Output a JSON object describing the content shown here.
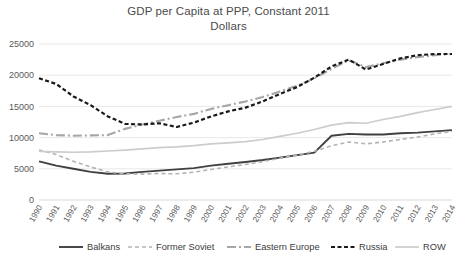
{
  "chart_data": {
    "type": "line",
    "title": "GDP per Capita at PPP, Constant 2011 Dollars",
    "title_line1": "GDP per Capita at PPP, Constant 2011",
    "title_line2": "Dollars",
    "xlabel": "",
    "ylabel": "",
    "ylim": [
      0,
      25000
    ],
    "yticks": [
      0,
      5000,
      10000,
      15000,
      20000,
      25000
    ],
    "ytick_labels": [
      "0",
      "5000",
      "10000",
      "15000",
      "20000",
      "25000"
    ],
    "grid": true,
    "legend_position": "bottom",
    "categories": [
      1990,
      1991,
      1992,
      1993,
      1994,
      1995,
      1996,
      1997,
      1998,
      1999,
      2000,
      2001,
      2002,
      2003,
      2004,
      2005,
      2006,
      2007,
      2008,
      2009,
      2010,
      2011,
      2012,
      2013,
      2014
    ],
    "xtick_labels": [
      "1990",
      "1991",
      "1992",
      "1993",
      "1994",
      "1995",
      "1996",
      "1997",
      "1998",
      "1999",
      "2000",
      "2001",
      "2002",
      "2003",
      "2004",
      "2005",
      "2006",
      "2007",
      "2008",
      "2009",
      "2010",
      "2011",
      "2012",
      "2013",
      "2014"
    ],
    "series": [
      {
        "name": "Balkans",
        "style": "solid",
        "color": "#404040",
        "width": 1.9,
        "dash": "none",
        "values": [
          6200,
          5500,
          5000,
          4500,
          4200,
          4250,
          4500,
          4700,
          4900,
          5100,
          5500,
          5800,
          6100,
          6400,
          6800,
          7200,
          7600,
          10300,
          10600,
          10500,
          10500,
          10700,
          10800,
          11000,
          11200
        ]
      },
      {
        "name": "Former Soviet",
        "style": "dashed",
        "color": "#b3b3b3",
        "width": 1.6,
        "dash": "4,3",
        "values": [
          8000,
          7300,
          6200,
          5300,
          4500,
          4200,
          4150,
          4250,
          4200,
          4450,
          4900,
          5300,
          5700,
          6150,
          6700,
          7200,
          7800,
          8700,
          9300,
          9000,
          9300,
          9700,
          10100,
          10600,
          11000
        ]
      },
      {
        "name": "Eastern Europe",
        "style": "dashdot",
        "color": "#a6a6a6",
        "width": 2.1,
        "dash": "9,3,2,3",
        "values": [
          10700,
          10400,
          10300,
          10350,
          10400,
          11400,
          12100,
          12700,
          13300,
          13800,
          14600,
          15200,
          15800,
          16500,
          17400,
          18300,
          19500,
          21000,
          22400,
          21300,
          21900,
          22500,
          22900,
          23200,
          23400
        ]
      },
      {
        "name": "Russia",
        "style": "dotted-bold",
        "color": "#1a1a1a",
        "width": 2.2,
        "dash": "4,2.5",
        "values": [
          19500,
          18600,
          16600,
          15200,
          13400,
          12200,
          12100,
          12300,
          11700,
          12400,
          13400,
          14200,
          14800,
          15800,
          17000,
          18100,
          19600,
          21400,
          22500,
          20900,
          21800,
          22700,
          23200,
          23400,
          23400
        ]
      },
      {
        "name": "ROW",
        "style": "solid-light",
        "color": "#cccccc",
        "width": 1.7,
        "dash": "none",
        "values": [
          7800,
          7700,
          7650,
          7700,
          7850,
          8000,
          8200,
          8400,
          8500,
          8700,
          9000,
          9150,
          9350,
          9700,
          10200,
          10700,
          11300,
          12000,
          12400,
          12300,
          12900,
          13400,
          14000,
          14500,
          15000
        ]
      }
    ]
  },
  "legend": {
    "items": [
      {
        "label": "Balkans"
      },
      {
        "label": "Former Soviet"
      },
      {
        "label": "Eastern Europe"
      },
      {
        "label": "Russia"
      },
      {
        "label": "ROW"
      }
    ]
  }
}
